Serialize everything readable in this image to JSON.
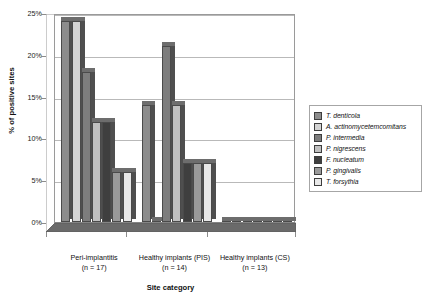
{
  "chart_data": {
    "type": "bar",
    "title": "",
    "xlabel": "Site category",
    "ylabel": "% of positive sites",
    "ylim": [
      0,
      25
    ],
    "yticks": [
      0,
      5,
      10,
      15,
      20,
      25
    ],
    "ytick_labels": [
      "0%",
      "5%",
      "10%",
      "15%",
      "20%",
      "25%"
    ],
    "grid": true,
    "legend_position": "right",
    "style": "3d-clustered-column",
    "categories": [
      "Peri-implantitis\n(n = 17)",
      "Healthy implants (PIS)\n(n = 14)",
      "Healthy implants (CS)\n(n = 13)"
    ],
    "category_lines": [
      [
        "Peri-implantitis",
        "(n = 17)"
      ],
      [
        "Healthy implants (PIS)",
        "(n = 14)"
      ],
      [
        "Healthy implants (CS)",
        "(n = 13)"
      ]
    ],
    "series": [
      {
        "name": "T. denticola",
        "color": "#8c8c8c",
        "values": [
          24,
          14,
          0
        ]
      },
      {
        "name": "A. actinomycetemcomitans",
        "color": "#d4d4d4",
        "values": [
          24,
          0,
          0
        ]
      },
      {
        "name": "P. intermedia",
        "color": "#7d7d7d",
        "values": [
          18,
          21,
          0
        ]
      },
      {
        "name": "P. nigrescens",
        "color": "#c0c0c0",
        "values": [
          12,
          14,
          0
        ]
      },
      {
        "name": "F. nucleatum",
        "color": "#3f3f3f",
        "values": [
          12,
          7,
          0
        ]
      },
      {
        "name": "P. gingivalis",
        "color": "#9a9a9a",
        "values": [
          6,
          7,
          0
        ]
      },
      {
        "name": "T. forsythia",
        "color": "#e8e8e8",
        "values": [
          6,
          7,
          0
        ]
      }
    ]
  }
}
